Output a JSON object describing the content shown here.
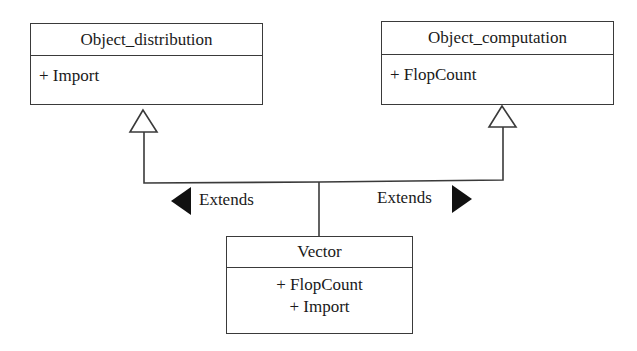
{
  "diagram": {
    "type": "uml-class-diagram",
    "classes": [
      {
        "id": "object_distribution",
        "name": "Object_distribution",
        "members": [
          "+ Import"
        ]
      },
      {
        "id": "object_computation",
        "name": "Object_computation",
        "members": [
          "+ FlopCount"
        ]
      },
      {
        "id": "vector",
        "name": "Vector",
        "members": [
          "+ FlopCount",
          "+ Import"
        ]
      }
    ],
    "relations": [
      {
        "from": "vector",
        "to": "object_distribution",
        "type": "generalization",
        "label": "Extends",
        "direction_arrow": "left"
      },
      {
        "from": "vector",
        "to": "object_computation",
        "type": "generalization",
        "label": "Extends",
        "direction_arrow": "right"
      }
    ]
  },
  "colors": {
    "line": "#3a3a3a",
    "text": "#1a1a1a",
    "arrow_fill": "#111111",
    "background": "#ffffff"
  }
}
